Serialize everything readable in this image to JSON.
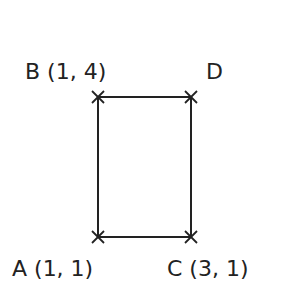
{
  "diagram": {
    "type": "rectangle-coordinates",
    "points": [
      {
        "id": "A",
        "label": "A (1, 1)"
      },
      {
        "id": "B",
        "label": "B (1, 4)"
      },
      {
        "id": "C",
        "label": "C (3, 1)"
      },
      {
        "id": "D",
        "label": "D"
      }
    ],
    "stroke_color": "#222222"
  }
}
